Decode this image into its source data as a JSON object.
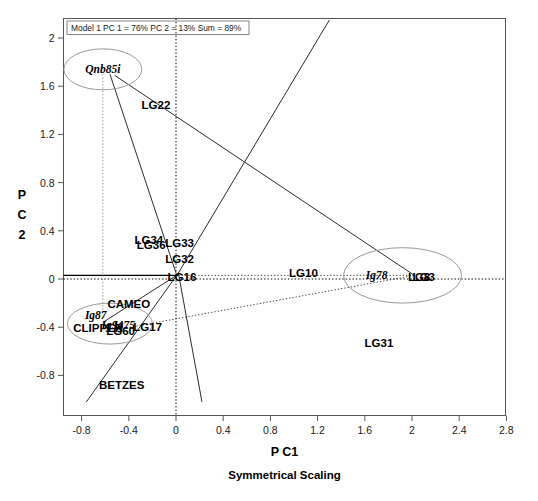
{
  "figure": {
    "model_note": "Model 1 PC 1 = 76% PC 2 = 13% Sum = 89%",
    "xlabel": "P C1",
    "ylabel_chars": [
      "P",
      "C",
      "2"
    ],
    "subtitle": "Symmetrical Scaling"
  },
  "chart_data": {
    "type": "scatter",
    "title": "Model 1 PC 1 = 76% PC 2 = 13% Sum = 89%",
    "xlabel": "P C1",
    "ylabel": "P C 2",
    "subtitle": "Symmetrical Scaling",
    "xlim": [
      -1.0,
      2.8
    ],
    "ylim": [
      -1.0,
      2.2
    ],
    "xticks": [
      "-0.8",
      "-0.4",
      "0",
      "0.4",
      "0.8",
      "1.2",
      "1.6",
      "2",
      "2.4",
      "2.8"
    ],
    "xtick_values": [
      -0.8,
      -0.4,
      0,
      0.4,
      0.8,
      1.2,
      1.6,
      2.0,
      2.4,
      2.8
    ],
    "yticks": [
      "-0.8",
      "-0.4",
      "0",
      "0.4",
      "0.8",
      "1.2",
      "1.6",
      "2"
    ],
    "ytick_values": [
      -0.8,
      -0.4,
      0,
      0.4,
      0.8,
      1.2,
      1.6,
      2.0
    ],
    "grid": false,
    "legend": "none",
    "reference_lines": [
      {
        "name": "zero-horizontal",
        "axis": "y",
        "value": 0,
        "style": "dotted"
      },
      {
        "name": "zero-vertical",
        "axis": "x",
        "value": 0,
        "style": "dotted"
      }
    ],
    "series": [
      {
        "name": "environments",
        "style": "bold-italic-serif",
        "points": [
          {
            "label": "Qnb85i",
            "x": -0.62,
            "y": 1.74
          },
          {
            "label": "Ig78",
            "x": 1.7,
            "y": 0.03
          },
          {
            "label": "Ig87",
            "x": -0.68,
            "y": -0.3
          },
          {
            "label": "Ig94",
            "x": -0.54,
            "y": -0.38
          },
          {
            "label": "Ig75",
            "x": -0.44,
            "y": -0.38
          }
        ]
      },
      {
        "name": "genotypes",
        "style": "bold-sans",
        "points": [
          {
            "label": "LG22",
            "x": -0.17,
            "y": 1.44
          },
          {
            "label": "LG34",
            "x": -0.23,
            "y": 0.32
          },
          {
            "label": "LG36",
            "x": -0.21,
            "y": 0.28
          },
          {
            "label": "LG33",
            "x": 0.03,
            "y": 0.3
          },
          {
            "label": "LG32",
            "x": 0.03,
            "y": 0.17
          },
          {
            "label": "LG16",
            "x": 0.05,
            "y": 0.02
          },
          {
            "label": "LG10",
            "x": 1.08,
            "y": 0.05
          },
          {
            "label": "LG8",
            "x": 2.06,
            "y": 0.02
          },
          {
            "label": "LG3",
            "x": 2.1,
            "y": 0.02
          },
          {
            "label": "CAMEO",
            "x": -0.4,
            "y": -0.21
          },
          {
            "label": "CLIPPER",
            "x": -0.66,
            "y": -0.41
          },
          {
            "label": "LG60",
            "x": -0.47,
            "y": -0.43
          },
          {
            "label": "LG17",
            "x": -0.24,
            "y": -0.4
          },
          {
            "label": "LG31",
            "x": 1.72,
            "y": -0.53
          },
          {
            "label": "BETZES",
            "x": -0.46,
            "y": -0.88
          }
        ]
      }
    ],
    "ellipses": [
      {
        "name": "group-qnb85i",
        "cx": -0.62,
        "cy": 1.74,
        "rx": 0.33,
        "ry": 0.17
      },
      {
        "name": "group-ig78-lg8",
        "cx": 1.92,
        "cy": 0.03,
        "rx": 0.5,
        "ry": 0.23
      },
      {
        "name": "group-clipper",
        "cx": -0.56,
        "cy": -0.37,
        "rx": 0.36,
        "ry": 0.17
      }
    ],
    "vectors": [
      {
        "name": "qnb85i-vector",
        "x1": -0.56,
        "y1": 1.7,
        "x2": 0.0,
        "y2": 0.05,
        "style": "solid"
      },
      {
        "name": "qnb85i-to-lg8",
        "x1": -0.52,
        "y1": 1.69,
        "x2": 2.02,
        "y2": 0.03,
        "style": "solid"
      },
      {
        "name": "ig78-vector",
        "x1": 0.02,
        "y1": 0.03,
        "x2": 2.0,
        "y2": 0.03,
        "style": "dotted"
      },
      {
        "name": "ig-cluster-vector",
        "x1": 0.02,
        "y1": 0.04,
        "x2": -0.62,
        "y2": -0.36,
        "style": "solid"
      },
      {
        "name": "lg31-dotted",
        "x1": -0.5,
        "y1": -0.42,
        "x2": 2.02,
        "y2": 0.03,
        "style": "dotted"
      },
      {
        "name": "upper-right-line",
        "x1": 0.02,
        "y1": 0.05,
        "x2": 1.3,
        "y2": 2.15,
        "style": "solid"
      },
      {
        "name": "lower-left-line",
        "x1": 0.02,
        "y1": 0.05,
        "x2": -0.76,
        "y2": -1.02,
        "style": "solid"
      },
      {
        "name": "lower-right-line",
        "x1": 0.02,
        "y1": 0.05,
        "x2": 0.22,
        "y2": -1.02,
        "style": "solid"
      }
    ]
  }
}
